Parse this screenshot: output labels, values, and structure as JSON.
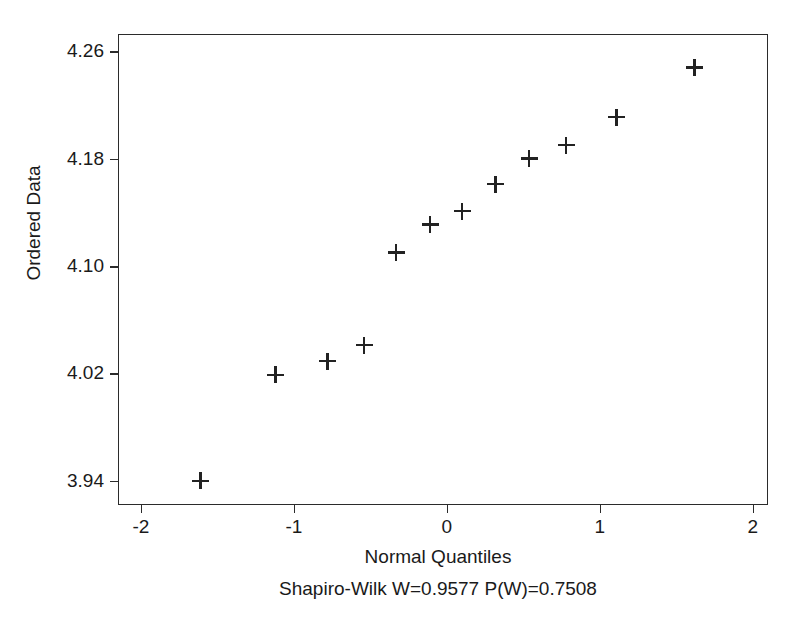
{
  "chart_data": {
    "type": "scatter",
    "title": "",
    "subtitle": "Shapiro-Wilk W=0.9577 P(W)=0.7508",
    "xlabel": "Normal Quantiles",
    "ylabel": "Ordered Data",
    "xlim": [
      -2.15,
      2.1
    ],
    "ylim": [
      3.922,
      4.273
    ],
    "grid": false,
    "legend": null,
    "marker": "plus",
    "marker_color": "#222222",
    "xticks": [
      -2,
      -1,
      0,
      1,
      2
    ],
    "xticklabels": [
      "-2",
      "-1",
      "0",
      "1",
      "2"
    ],
    "yticks": [
      3.94,
      4.02,
      4.1,
      4.18,
      4.26
    ],
    "yticklabels": [
      "3.94",
      "4.02",
      "4.10",
      "4.18",
      "4.26"
    ],
    "n_points": 12,
    "x": [
      -1.61,
      -1.12,
      -0.78,
      -0.54,
      -0.33,
      -0.11,
      0.1,
      0.32,
      0.54,
      0.78,
      1.11,
      1.62
    ],
    "y": [
      3.94,
      4.019,
      4.029,
      4.041,
      4.11,
      4.131,
      4.141,
      4.161,
      4.18,
      4.19,
      4.211,
      4.248
    ],
    "points": [
      {
        "x": -1.61,
        "y": 3.94
      },
      {
        "x": -1.12,
        "y": 4.019
      },
      {
        "x": -0.78,
        "y": 4.029
      },
      {
        "x": -0.54,
        "y": 4.041
      },
      {
        "x": -0.33,
        "y": 4.11
      },
      {
        "x": -0.11,
        "y": 4.131
      },
      {
        "x": 0.1,
        "y": 4.141
      },
      {
        "x": 0.32,
        "y": 4.161
      },
      {
        "x": 0.54,
        "y": 4.18
      },
      {
        "x": 0.78,
        "y": 4.19
      },
      {
        "x": 1.11,
        "y": 4.211
      },
      {
        "x": 1.62,
        "y": 4.248
      }
    ],
    "statistics": {
      "test": "Shapiro-Wilk",
      "W": "0.9577",
      "P(W)": "0.7508"
    }
  }
}
